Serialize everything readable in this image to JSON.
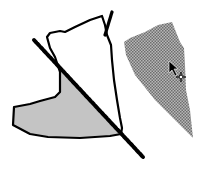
{
  "illustration": {
    "description": "Boot-shaped drawing being split by a cut line; the separated piece is moved with a move cursor",
    "colors": {
      "background": "#ffffff",
      "outline": "#000000",
      "cut_region_fill": "#c4c4c4",
      "moved_piece_fill": "#9a9a9a",
      "cut_line": "#000000"
    },
    "shapes": [
      {
        "name": "boot-outline",
        "type": "outlined shape"
      },
      {
        "name": "cut-region",
        "type": "filled shaded region (lower-left of cut line)"
      },
      {
        "name": "cut-line",
        "type": "thick diagonal line"
      },
      {
        "name": "moved-piece",
        "type": "stippled gray fill (moved fragment)"
      }
    ],
    "cursor": {
      "icon": "move-arrow-cursor"
    }
  }
}
